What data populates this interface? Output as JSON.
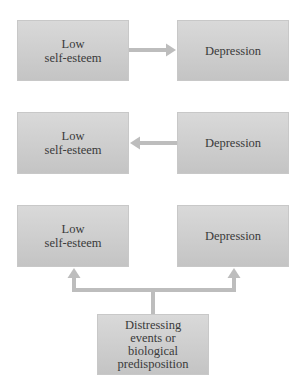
{
  "diagram": {
    "row1": {
      "left_label": "Low\nself-esteem",
      "right_label": "Depression",
      "arrow": "left-to-right"
    },
    "row2": {
      "left_label": "Low\nself-esteem",
      "right_label": "Depression",
      "arrow": "right-to-left"
    },
    "row3": {
      "left_label": "Low\nself-esteem",
      "right_label": "Depression",
      "cause_label": "Distressing\nevents or\nbiological\npredisposition",
      "arrow": "cause-to-both"
    },
    "colors": {
      "box_top": "#d9d9d9",
      "box_bottom": "#c4c4c4",
      "arrow": "#bdbdbd",
      "text": "#3a3a3a"
    }
  }
}
